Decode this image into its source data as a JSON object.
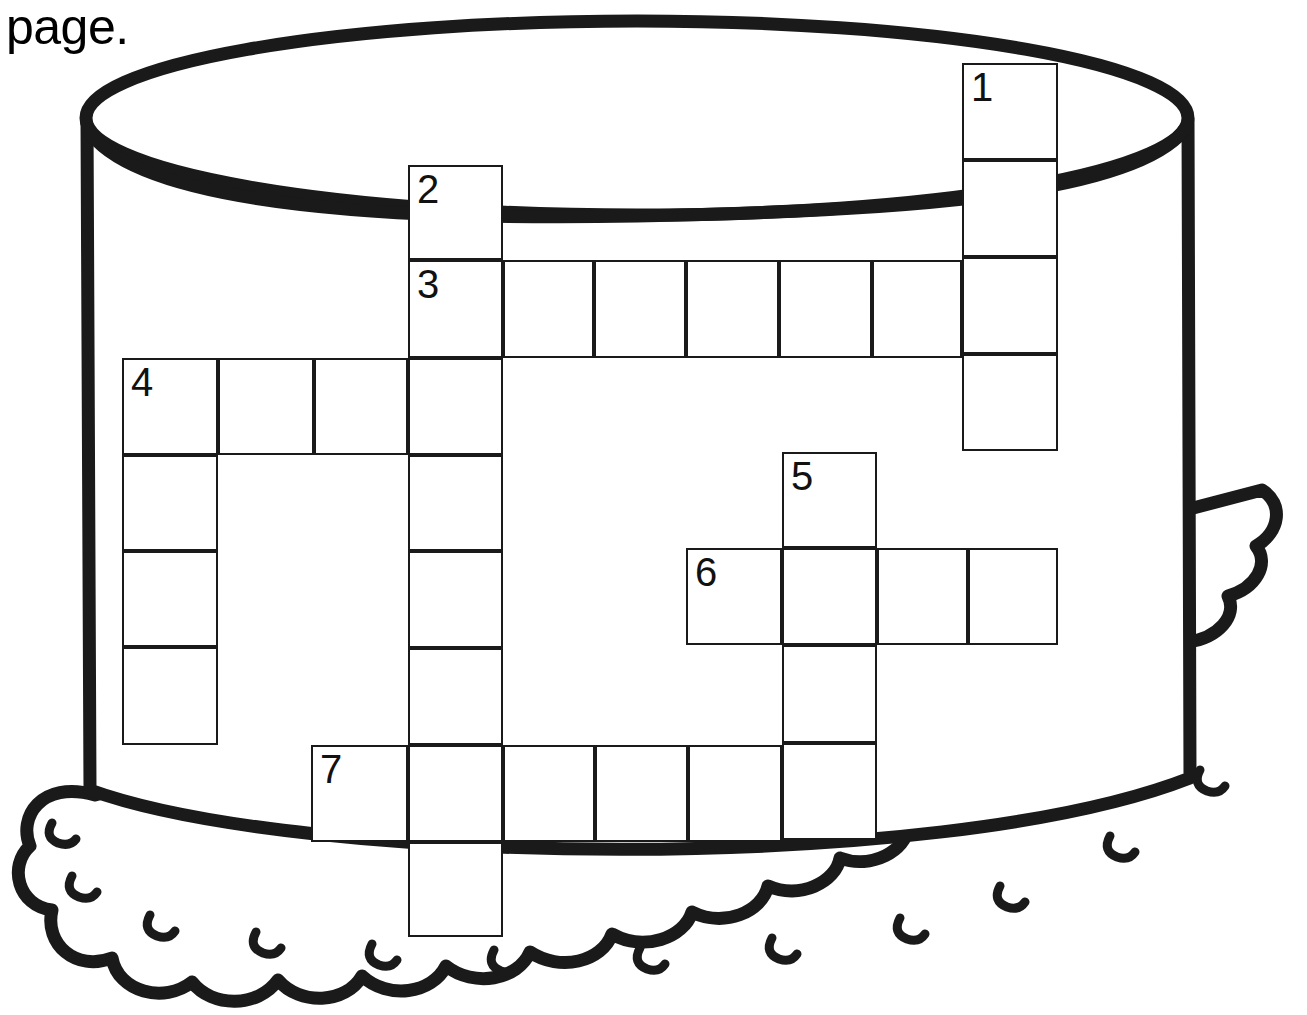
{
  "worksheet": {
    "instruction_tail": "page.",
    "clipped_mark": "|"
  },
  "artwork": {
    "name": "birthday-cake",
    "description": "Line-drawn round layer cake with scalloped frosting base",
    "stroke_color": "#1a1a1a",
    "fill_color": "#ffffff",
    "top_ellipse": {
      "cx": 637,
      "cy": 118,
      "rx": 552,
      "ry": 98
    },
    "body": {
      "left": 85,
      "right": 1190,
      "top": 118,
      "bottom": 810
    },
    "scallop_count": 13,
    "scallop_tick_count": 12
  },
  "crossword": {
    "cell_size": 96,
    "border_color": "#1a1a1a",
    "cell_fill": "#ffffff",
    "entries": [
      {
        "number": "1",
        "direction": "down",
        "x": 962,
        "y": 63,
        "length": 4
      },
      {
        "number": "2",
        "direction": "down",
        "x": 408,
        "y": 165,
        "length": 8
      },
      {
        "number": "3",
        "direction": "across",
        "x": 408,
        "y": 260,
        "length": 6
      },
      {
        "number": "4",
        "direction": "across",
        "x": 122,
        "y": 358,
        "length": 4
      },
      {
        "number": "4",
        "direction": "down",
        "x": 122,
        "y": 358,
        "length": 4
      },
      {
        "number": "5",
        "direction": "down",
        "x": 782,
        "y": 452,
        "length": 4
      },
      {
        "number": "6",
        "direction": "across",
        "x": 686,
        "y": 548,
        "length": 4
      },
      {
        "number": "7",
        "direction": "across",
        "x": 311,
        "y": 745,
        "length": 6
      }
    ],
    "cells": [
      {
        "x": 962,
        "y": 63,
        "w": 96,
        "h": 97,
        "num": "1"
      },
      {
        "x": 962,
        "y": 160,
        "w": 96,
        "h": 97,
        "num": ""
      },
      {
        "x": 962,
        "y": 257,
        "w": 96,
        "h": 97,
        "num": ""
      },
      {
        "x": 962,
        "y": 354,
        "w": 96,
        "h": 97,
        "num": ""
      },
      {
        "x": 408,
        "y": 165,
        "w": 95,
        "h": 95,
        "num": "2"
      },
      {
        "x": 408,
        "y": 260,
        "w": 95,
        "h": 98,
        "num": "3"
      },
      {
        "x": 503,
        "y": 260,
        "w": 91,
        "h": 98,
        "num": ""
      },
      {
        "x": 594,
        "y": 260,
        "w": 92,
        "h": 98,
        "num": ""
      },
      {
        "x": 686,
        "y": 260,
        "w": 93,
        "h": 98,
        "num": ""
      },
      {
        "x": 779,
        "y": 260,
        "w": 93,
        "h": 98,
        "num": ""
      },
      {
        "x": 872,
        "y": 260,
        "w": 90,
        "h": 98,
        "num": ""
      },
      {
        "x": 122,
        "y": 358,
        "w": 96,
        "h": 97,
        "num": "4"
      },
      {
        "x": 218,
        "y": 358,
        "w": 96,
        "h": 97,
        "num": ""
      },
      {
        "x": 314,
        "y": 358,
        "w": 94,
        "h": 97,
        "num": ""
      },
      {
        "x": 408,
        "y": 358,
        "w": 95,
        "h": 97,
        "num": ""
      },
      {
        "x": 122,
        "y": 455,
        "w": 96,
        "h": 96,
        "num": ""
      },
      {
        "x": 122,
        "y": 551,
        "w": 96,
        "h": 96,
        "num": ""
      },
      {
        "x": 122,
        "y": 647,
        "w": 96,
        "h": 98,
        "num": ""
      },
      {
        "x": 408,
        "y": 455,
        "w": 95,
        "h": 96,
        "num": ""
      },
      {
        "x": 408,
        "y": 551,
        "w": 95,
        "h": 97,
        "num": ""
      },
      {
        "x": 408,
        "y": 648,
        "w": 95,
        "h": 97,
        "num": ""
      },
      {
        "x": 782,
        "y": 452,
        "w": 95,
        "h": 96,
        "num": "5"
      },
      {
        "x": 686,
        "y": 548,
        "w": 96,
        "h": 97,
        "num": "6"
      },
      {
        "x": 782,
        "y": 548,
        "w": 95,
        "h": 97,
        "num": ""
      },
      {
        "x": 877,
        "y": 548,
        "w": 91,
        "h": 97,
        "num": ""
      },
      {
        "x": 968,
        "y": 548,
        "w": 90,
        "h": 97,
        "num": ""
      },
      {
        "x": 782,
        "y": 645,
        "w": 95,
        "h": 98,
        "num": ""
      },
      {
        "x": 782,
        "y": 743,
        "w": 95,
        "h": 97,
        "num": ""
      },
      {
        "x": 311,
        "y": 745,
        "w": 97,
        "h": 97,
        "num": "7"
      },
      {
        "x": 408,
        "y": 745,
        "w": 95,
        "h": 97,
        "num": ""
      },
      {
        "x": 503,
        "y": 745,
        "w": 92,
        "h": 97,
        "num": ""
      },
      {
        "x": 595,
        "y": 745,
        "w": 93,
        "h": 97,
        "num": ""
      },
      {
        "x": 688,
        "y": 745,
        "w": 94,
        "h": 97,
        "num": ""
      },
      {
        "x": 408,
        "y": 842,
        "w": 95,
        "h": 95,
        "num": ""
      }
    ]
  }
}
